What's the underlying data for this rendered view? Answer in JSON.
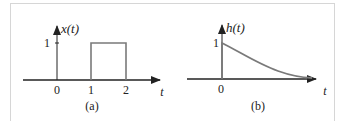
{
  "figure": {
    "panels": [
      {
        "id": "a",
        "caption": "(a)",
        "function_label": "x(t)",
        "axis_var": "t",
        "ytick": "1",
        "xticks": [
          "0",
          "1",
          "2"
        ],
        "description": "Rectangular pulse of height 1 from t=1 to t=2"
      },
      {
        "id": "b",
        "caption": "(b)",
        "function_label": "h(t)",
        "axis_var": "t",
        "ytick": "1",
        "xticks": [
          "0"
        ],
        "description": "Decaying exponential starting at 1 at t=0"
      }
    ],
    "colors": {
      "axis": "#222222",
      "signal": "#7a7a7a",
      "frame": "#d6d6d6"
    }
  }
}
